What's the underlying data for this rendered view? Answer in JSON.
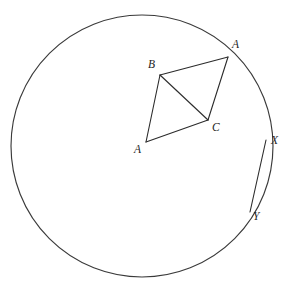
{
  "figure": {
    "background_color": "#ffffff",
    "stroke_color": "#2b2b2b",
    "circle_stroke_color": "#3a3a3a"
  },
  "circle": {
    "name": "main-circle",
    "cx": 142,
    "cy": 146,
    "r": 131
  },
  "quadrilateral": {
    "name": "quadrilateral-ABCA",
    "vertices": [
      {
        "id": "A-top",
        "label": "A",
        "x": 228,
        "y": 57,
        "label_x": 232,
        "label_y": 39
      },
      {
        "id": "B",
        "label": "B",
        "x": 160,
        "y": 75,
        "label_x": 148,
        "label_y": 59
      },
      {
        "id": "A-bottom",
        "label": "A",
        "x": 146,
        "y": 142,
        "label_x": 134,
        "label_y": 144
      },
      {
        "id": "C",
        "label": "C",
        "x": 208,
        "y": 120,
        "label_x": 212,
        "label_y": 122
      }
    ],
    "edges": [
      {
        "from": "A-top",
        "to": "B"
      },
      {
        "from": "B",
        "to": "A-bottom"
      },
      {
        "from": "A-bottom",
        "to": "C"
      },
      {
        "from": "C",
        "to": "A-top"
      }
    ],
    "diagonal": {
      "from": "B",
      "to": "C"
    }
  },
  "arc_lens": {
    "name": "arc-XY",
    "points": [
      {
        "id": "X",
        "label": "X",
        "x": 266,
        "y": 140,
        "label_x": 271,
        "label_y": 135
      },
      {
        "id": "Y",
        "label": "Y",
        "x": 250,
        "y": 212,
        "label_x": 253,
        "label_y": 211
      }
    ],
    "inner_arc_sweep": "slight-inward-bow"
  },
  "labels": {
    "A_top": "A",
    "B": "B",
    "A_bottom": "A",
    "C": "C",
    "X": "X",
    "Y": "Y"
  }
}
